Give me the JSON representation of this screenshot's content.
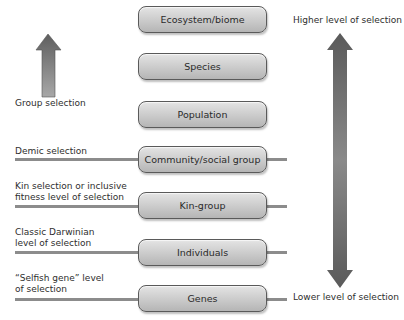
{
  "levels": [
    {
      "name": "Ecosystem/biome",
      "top": 6,
      "has_line": false
    },
    {
      "name": "Species",
      "top": 53,
      "has_line": false
    },
    {
      "name": "Population",
      "top": 101,
      "has_line": false
    },
    {
      "name": "Community/social group",
      "top": 146,
      "has_line": true
    },
    {
      "name": "Kin-group",
      "top": 192,
      "has_line": true
    },
    {
      "name": "Individuals",
      "top": 239,
      "has_line": true
    },
    {
      "name": "Genes",
      "top": 285,
      "has_line": true
    }
  ],
  "left_labels": {
    "group": "Group selection",
    "demic": "Demic selection",
    "kin_line1": "Kin selection or inclusive",
    "kin_line2": "fitness level of selection",
    "darwin_line1": "Classic Darwinian",
    "darwin_line2": "level of selection",
    "gene_line1": "“Selfish gene” level",
    "gene_line2": "of selection"
  },
  "right_labels": {
    "higher": "Higher level of selection",
    "lower": "Lower level of selection"
  },
  "colors": {
    "box_fill": "#c8c8c8",
    "box_border": "#5a5a5a",
    "arrow": "#6e6e6e",
    "line": "#8c8c8c"
  }
}
